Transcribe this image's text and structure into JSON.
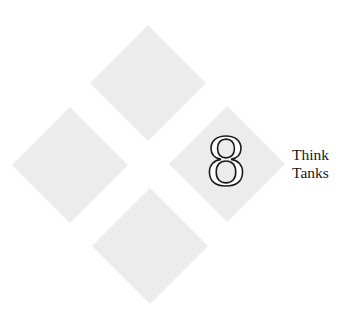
{
  "chapter": {
    "number": "8",
    "title_lines": [
      "Think",
      "Tanks"
    ]
  },
  "decoration": {
    "diamond_color": "#ececec",
    "diamonds": [
      "top",
      "left",
      "right",
      "bottom"
    ]
  }
}
